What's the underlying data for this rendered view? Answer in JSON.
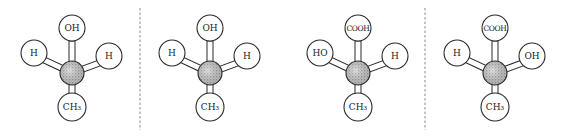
{
  "diagram": {
    "colors": {
      "stroke": "#2a2a2a",
      "divider": "#8a8a8a",
      "center_fill": "stippled gray"
    },
    "molecules": [
      {
        "id": 1,
        "top": "OH",
        "left": "H",
        "right": "H",
        "bottom": "CH₃"
      },
      {
        "id": 2,
        "top": "OH",
        "left": "H",
        "right": "H",
        "bottom": "CH₃"
      },
      {
        "id": 3,
        "top": "COOH",
        "left": "HO",
        "right": "H",
        "bottom": "CH₃"
      },
      {
        "id": 4,
        "top": "COOH",
        "left": "H",
        "right": "OH",
        "bottom": "CH₃"
      }
    ],
    "dividers": [
      {
        "position": "between molecule 1 and 2",
        "style": "dashed"
      },
      {
        "position": "between molecule 3 and 4",
        "style": "dashed"
      }
    ]
  }
}
